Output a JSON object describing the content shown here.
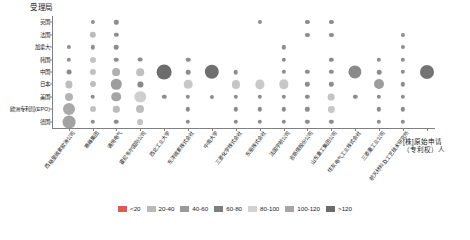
{
  "chart_data": {
    "type": "scatter",
    "title": "",
    "ylabel": "受理局",
    "xlabel": "[株]原始申请（专利权）人",
    "legend_position": "bottom",
    "grid": false,
    "y_categories": [
      "英国",
      "法国",
      "加拿大",
      "韩国",
      "中国",
      "日本",
      "美国",
      "欧洲专利局(EPO)",
      "德国"
    ],
    "x_categories": [
      "西格里碳素欧洲公司",
      "赛峰集团",
      "通用电气",
      "霍尼韦尔国际公司",
      "西北工业大学",
      "东洋碳素株式会社",
      "中南大学",
      "三菱化学株式会社",
      "东丽株式会社",
      "法国宇航公司",
      "吉斯塔股份公司",
      "山东重工集团公司",
      "住友电气工业株式会社",
      "三菱重工业公司",
      "航天材料及工艺技术研究所"
    ],
    "legend_entries": [
      {
        "label": "<20",
        "color": "#e05a4e"
      },
      {
        "label": "20-40",
        "color": "#b9b9b9"
      },
      {
        "label": "40-60",
        "color": "#9a9a9a"
      },
      {
        "label": "60-80",
        "color": "#7d7d7d"
      },
      {
        "label": "80-100",
        "color": "#d2d2d2"
      },
      {
        "label": "100-120",
        "color": "#a6a6a6"
      },
      {
        "label": ">120",
        "color": "#6b6b6b"
      }
    ],
    "bins": [
      {
        "max": 20,
        "color": "#a8a8a8"
      },
      {
        "max": 40,
        "color": "#b9b9b9"
      },
      {
        "max": 60,
        "color": "#9a9a9a"
      },
      {
        "max": 80,
        "color": "#7d7d7d"
      },
      {
        "max": 100,
        "color": "#d2d2d2"
      },
      {
        "max": 120,
        "color": "#a6a6a6"
      },
      {
        "max": 9999,
        "color": "#6b6b6b"
      }
    ],
    "points": [
      {
        "x": 0,
        "y": "加拿大",
        "value": 10,
        "r": 2.1,
        "color": "#8f8f8f"
      },
      {
        "x": 0,
        "y": "韩国",
        "value": 12,
        "r": 2.2,
        "color": "#8f8f8f"
      },
      {
        "x": 0,
        "y": "中国",
        "value": 14,
        "r": 2.4,
        "color": "#8a8a8a"
      },
      {
        "x": 0,
        "y": "日本",
        "value": 38,
        "r": 3.6,
        "color": "#bdbdbd"
      },
      {
        "x": 0,
        "y": "美国",
        "value": 46,
        "r": 4.0,
        "color": "#b4b4b4"
      },
      {
        "x": 0,
        "y": "欧洲专利局(EPO)",
        "value": 92,
        "r": 6.0,
        "color": "#a9a9a9"
      },
      {
        "x": 0,
        "y": "德国",
        "value": 98,
        "r": 6.4,
        "color": "#a2a2a2"
      },
      {
        "x": 1,
        "y": "英国",
        "value": 9,
        "r": 2.1,
        "color": "#909090"
      },
      {
        "x": 1,
        "y": "法国",
        "value": 30,
        "r": 3.2,
        "color": "#bcbcbc"
      },
      {
        "x": 1,
        "y": "加拿大",
        "value": 11,
        "r": 2.2,
        "color": "#909090"
      },
      {
        "x": 1,
        "y": "韩国",
        "value": 26,
        "r": 3.0,
        "color": "#c4c4c4"
      },
      {
        "x": 1,
        "y": "中国",
        "value": 28,
        "r": 3.1,
        "color": "#c0c0c0"
      },
      {
        "x": 1,
        "y": "日本",
        "value": 27,
        "r": 3.0,
        "color": "#bebebe"
      },
      {
        "x": 1,
        "y": "美国",
        "value": 14,
        "r": 2.3,
        "color": "#8d8d8d"
      },
      {
        "x": 1,
        "y": "欧洲专利局(EPO)",
        "value": 25,
        "r": 3.0,
        "color": "#c2c2c2"
      },
      {
        "x": 1,
        "y": "德国",
        "value": 12,
        "r": 2.2,
        "color": "#8f8f8f"
      },
      {
        "x": 2,
        "y": "英国",
        "value": 11,
        "r": 2.2,
        "color": "#8d8d8d"
      },
      {
        "x": 2,
        "y": "法国",
        "value": 12,
        "r": 2.2,
        "color": "#8d8d8d"
      },
      {
        "x": 2,
        "y": "加拿大",
        "value": 13,
        "r": 2.3,
        "color": "#8d8d8d"
      },
      {
        "x": 2,
        "y": "韩国",
        "value": 13,
        "r": 2.3,
        "color": "#8d8d8d"
      },
      {
        "x": 2,
        "y": "中国",
        "value": 42,
        "r": 3.9,
        "color": "#b0b0b0"
      },
      {
        "x": 2,
        "y": "日本",
        "value": 70,
        "r": 5.2,
        "color": "#9e9e9e"
      },
      {
        "x": 2,
        "y": "美国",
        "value": 62,
        "r": 4.8,
        "color": "#a5a5a5"
      },
      {
        "x": 2,
        "y": "欧洲专利局(EPO)",
        "value": 30,
        "r": 3.2,
        "color": "#bababa"
      },
      {
        "x": 2,
        "y": "德国",
        "value": 13,
        "r": 2.3,
        "color": "#8d8d8d"
      },
      {
        "x": 3,
        "y": "韩国",
        "value": 14,
        "r": 2.4,
        "color": "#8d8d8d"
      },
      {
        "x": 3,
        "y": "中国",
        "value": 40,
        "r": 3.8,
        "color": "#c0c0c0"
      },
      {
        "x": 3,
        "y": "日本",
        "value": 17,
        "r": 2.6,
        "color": "#8a8a8a"
      },
      {
        "x": 3,
        "y": "美国",
        "value": 84,
        "r": 5.7,
        "color": "#cfcfcf"
      },
      {
        "x": 3,
        "y": "欧洲专利局(EPO)",
        "value": 44,
        "r": 4.0,
        "color": "#bdbdbd"
      },
      {
        "x": 3,
        "y": "德国",
        "value": 24,
        "r": 2.9,
        "color": "#c2c2c2"
      },
      {
        "x": 4,
        "y": "中国",
        "value": 128,
        "r": 7.4,
        "color": "#6d6d6d"
      },
      {
        "x": 4,
        "y": "美国",
        "value": 11,
        "r": 2.2,
        "color": "#8d8d8d"
      },
      {
        "x": 5,
        "y": "韩国",
        "value": 13,
        "r": 2.3,
        "color": "#8d8d8d"
      },
      {
        "x": 5,
        "y": "中国",
        "value": 14,
        "r": 2.3,
        "color": "#8d8d8d"
      },
      {
        "x": 5,
        "y": "日本",
        "value": 52,
        "r": 4.3,
        "color": "#c8c8c8"
      },
      {
        "x": 5,
        "y": "美国",
        "value": 12,
        "r": 2.2,
        "color": "#8d8d8d"
      },
      {
        "x": 5,
        "y": "欧洲专利局(EPO)",
        "value": 12,
        "r": 2.2,
        "color": "#8d8d8d"
      },
      {
        "x": 5,
        "y": "德国",
        "value": 12,
        "r": 2.2,
        "color": "#8d8d8d"
      },
      {
        "x": 6,
        "y": "中国",
        "value": 126,
        "r": 7.2,
        "color": "#6f6f6f"
      },
      {
        "x": 6,
        "y": "美国",
        "value": 10,
        "r": 2.1,
        "color": "#8d8d8d"
      },
      {
        "x": 7,
        "y": "中国",
        "value": 13,
        "r": 2.3,
        "color": "#8d8d8d"
      },
      {
        "x": 7,
        "y": "日本",
        "value": 46,
        "r": 4.1,
        "color": "#c6c6c6"
      },
      {
        "x": 7,
        "y": "美国",
        "value": 11,
        "r": 2.2,
        "color": "#8d8d8d"
      },
      {
        "x": 7,
        "y": "欧洲专利局(EPO)",
        "value": 11,
        "r": 2.2,
        "color": "#8d8d8d"
      },
      {
        "x": 7,
        "y": "德国",
        "value": 11,
        "r": 2.2,
        "color": "#8d8d8d"
      },
      {
        "x": 8,
        "y": "英国",
        "value": 10,
        "r": 2.1,
        "color": "#8d8d8d"
      },
      {
        "x": 8,
        "y": "日本",
        "value": 58,
        "r": 4.6,
        "color": "#c9c9c9"
      },
      {
        "x": 8,
        "y": "美国",
        "value": 12,
        "r": 2.2,
        "color": "#8d8d8d"
      },
      {
        "x": 8,
        "y": "欧洲专利局(EPO)",
        "value": 11,
        "r": 2.2,
        "color": "#8d8d8d"
      },
      {
        "x": 8,
        "y": "德国",
        "value": 11,
        "r": 2.2,
        "color": "#8d8d8d"
      },
      {
        "x": 9,
        "y": "加拿大",
        "value": 11,
        "r": 2.2,
        "color": "#8d8d8d"
      },
      {
        "x": 9,
        "y": "韩国",
        "value": 11,
        "r": 2.2,
        "color": "#8d8d8d"
      },
      {
        "x": 9,
        "y": "中国",
        "value": 12,
        "r": 2.2,
        "color": "#8d8d8d"
      },
      {
        "x": 9,
        "y": "日本",
        "value": 60,
        "r": 4.7,
        "color": "#c7c7c7"
      },
      {
        "x": 9,
        "y": "美国",
        "value": 12,
        "r": 2.2,
        "color": "#8d8d8d"
      },
      {
        "x": 9,
        "y": "欧洲专利局(EPO)",
        "value": 11,
        "r": 2.2,
        "color": "#8d8d8d"
      },
      {
        "x": 9,
        "y": "德国",
        "value": 11,
        "r": 2.2,
        "color": "#8d8d8d"
      },
      {
        "x": 10,
        "y": "英国",
        "value": 10,
        "r": 2.1,
        "color": "#8d8d8d"
      },
      {
        "x": 10,
        "y": "法国",
        "value": 10,
        "r": 2.1,
        "color": "#8d8d8d"
      },
      {
        "x": 10,
        "y": "中国",
        "value": 11,
        "r": 2.2,
        "color": "#8d8d8d"
      },
      {
        "x": 10,
        "y": "日本",
        "value": 11,
        "r": 2.2,
        "color": "#8d8d8d"
      },
      {
        "x": 10,
        "y": "美国",
        "value": 11,
        "r": 2.2,
        "color": "#8d8d8d"
      },
      {
        "x": 10,
        "y": "欧洲专利局(EPO)",
        "value": 11,
        "r": 2.2,
        "color": "#8d8d8d"
      },
      {
        "x": 10,
        "y": "德国",
        "value": 11,
        "r": 2.2,
        "color": "#8d8d8d"
      },
      {
        "x": 11,
        "y": "英国",
        "value": 10,
        "r": 2.1,
        "color": "#8d8d8d"
      },
      {
        "x": 11,
        "y": "法国",
        "value": 10,
        "r": 2.1,
        "color": "#8d8d8d"
      },
      {
        "x": 11,
        "y": "韩国",
        "value": 11,
        "r": 2.2,
        "color": "#8d8d8d"
      },
      {
        "x": 11,
        "y": "中国",
        "value": 11,
        "r": 2.2,
        "color": "#8d8d8d"
      },
      {
        "x": 11,
        "y": "日本",
        "value": 11,
        "r": 2.2,
        "color": "#8d8d8d"
      },
      {
        "x": 11,
        "y": "美国",
        "value": 34,
        "r": 3.4,
        "color": "#c4c4c4"
      },
      {
        "x": 11,
        "y": "欧洲专利局(EPO)",
        "value": 28,
        "r": 3.1,
        "color": "#c8c8c8"
      },
      {
        "x": 11,
        "y": "德国",
        "value": 11,
        "r": 2.2,
        "color": "#8d8d8d"
      },
      {
        "x": 12,
        "y": "中国",
        "value": 122,
        "r": 6.6,
        "color": "#8a8a8a"
      },
      {
        "x": 12,
        "y": "美国",
        "value": 11,
        "r": 2.2,
        "color": "#8d8d8d"
      },
      {
        "x": 13,
        "y": "韩国",
        "value": 12,
        "r": 2.2,
        "color": "#8d8d8d"
      },
      {
        "x": 13,
        "y": "中国",
        "value": 13,
        "r": 2.3,
        "color": "#8d8d8d"
      },
      {
        "x": 13,
        "y": "日本",
        "value": 66,
        "r": 5.0,
        "color": "#9d9d9d"
      },
      {
        "x": 13,
        "y": "美国",
        "value": 12,
        "r": 2.2,
        "color": "#8d8d8d"
      },
      {
        "x": 13,
        "y": "欧洲专利局(EPO)",
        "value": 11,
        "r": 2.2,
        "color": "#8d8d8d"
      },
      {
        "x": 13,
        "y": "德国",
        "value": 11,
        "r": 2.2,
        "color": "#8d8d8d"
      },
      {
        "x": 14,
        "y": "法国",
        "value": 10,
        "r": 2.1,
        "color": "#8d8d8d"
      },
      {
        "x": 14,
        "y": "加拿大",
        "value": 10,
        "r": 2.1,
        "color": "#8d8d8d"
      },
      {
        "x": 14,
        "y": "韩国",
        "value": 11,
        "r": 2.2,
        "color": "#8d8d8d"
      },
      {
        "x": 14,
        "y": "中国",
        "value": 11,
        "r": 2.2,
        "color": "#8d8d8d"
      },
      {
        "x": 14,
        "y": "日本",
        "value": 11,
        "r": 2.2,
        "color": "#8d8d8d"
      },
      {
        "x": 14,
        "y": "美国",
        "value": 11,
        "r": 2.2,
        "color": "#8d8d8d"
      },
      {
        "x": 14,
        "y": "欧洲专利局(EPO)",
        "value": 11,
        "r": 2.2,
        "color": "#8d8d8d"
      },
      {
        "x": 14,
        "y": "德国",
        "value": 11,
        "r": 2.2,
        "color": "#8d8d8d"
      },
      {
        "x": 15,
        "y": "中国",
        "value": 124,
        "r": 7.0,
        "color": "#747474"
      }
    ]
  }
}
